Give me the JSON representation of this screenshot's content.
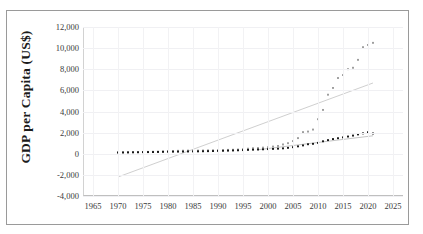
{
  "figure": {
    "clipped_header_text": "",
    "frame": {
      "border_color": "#9a9a9a"
    }
  },
  "chart_data": {
    "type": "scatter",
    "title": "",
    "xlabel": "",
    "ylabel": "GDP per Capita (US$)",
    "xlim": [
      1963,
      2027
    ],
    "ylim": [
      -4000,
      12000
    ],
    "xticks": [
      1965,
      1970,
      1975,
      1980,
      1985,
      1990,
      1995,
      2000,
      2005,
      2010,
      2015,
      2020,
      2025
    ],
    "xtick_labels": [
      "1965",
      "1970",
      "1975",
      "1980",
      "1985",
      "1990",
      "1995",
      "2000",
      "2005",
      "2010",
      "2015",
      "2020",
      "2025"
    ],
    "yticks": [
      12000,
      10000,
      8000,
      6000,
      4000,
      2000,
      0,
      -2000,
      -4000
    ],
    "ytick_labels": [
      "12,000",
      "10,000",
      "8,000",
      "6,000",
      "4,000",
      "2,000",
      "0",
      "-2,000",
      "-4,000"
    ],
    "grid": true,
    "legend": "none",
    "x": [
      1970,
      1971,
      1972,
      1973,
      1974,
      1975,
      1976,
      1977,
      1978,
      1979,
      1980,
      1981,
      1982,
      1983,
      1984,
      1985,
      1986,
      1987,
      1988,
      1989,
      1990,
      1991,
      1992,
      1993,
      1994,
      1995,
      1996,
      1997,
      1998,
      1999,
      2000,
      2001,
      2002,
      2003,
      2004,
      2005,
      2006,
      2007,
      2008,
      2009,
      2010,
      2011,
      2012,
      2013,
      2014,
      2015,
      2016,
      2017,
      2018,
      2019,
      2020,
      2021
    ],
    "series": [
      {
        "name": "series-gray",
        "marker": "square",
        "color": "#9a9a9a",
        "values": [
          110,
          120,
          135,
          155,
          160,
          175,
          180,
          195,
          205,
          230,
          250,
          265,
          280,
          290,
          300,
          300,
          300,
          310,
          320,
          330,
          340,
          350,
          370,
          380,
          400,
          440,
          480,
          520,
          540,
          580,
          620,
          680,
          740,
          880,
          1000,
          1200,
          1480,
          2050,
          2100,
          2290,
          3270,
          4150,
          5590,
          6230,
          7170,
          7450,
          8010,
          8140,
          8890,
          10090,
          10300,
          10500
        ]
      },
      {
        "name": "series-black",
        "marker": "square",
        "color": "#111111",
        "values": [
          120,
          125,
          130,
          135,
          140,
          150,
          155,
          160,
          170,
          180,
          190,
          195,
          200,
          205,
          215,
          220,
          225,
          235,
          245,
          255,
          270,
          280,
          295,
          310,
          325,
          345,
          365,
          385,
          400,
          420,
          440,
          460,
          480,
          510,
          560,
          620,
          700,
          790,
          900,
          940,
          1030,
          1180,
          1290,
          1390,
          1470,
          1550,
          1630,
          1720,
          1830,
          1930,
          2040,
          1920
        ]
      }
    ],
    "trendlines": [
      {
        "name": "trendline-gray",
        "color": "#c9c9c9",
        "style": "solid",
        "x_start": 1970,
        "y_start": -2200,
        "x_end": 2021,
        "y_end": 6700
      },
      {
        "name": "trendline-black",
        "color": "#bdbdbd",
        "style": "solid",
        "x_start": 1998,
        "y_start": 380,
        "x_end": 2021,
        "y_end": 1700
      }
    ]
  }
}
